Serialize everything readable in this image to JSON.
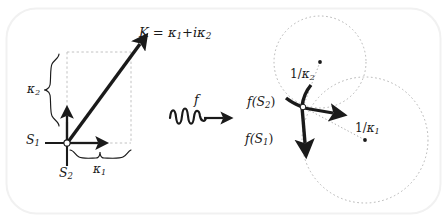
{
  "figure": {
    "background_color": "#ffffff",
    "frame_color": "#f0f0f0",
    "ink_color": "#1a1a1a",
    "dash_color": "#b0b0b0"
  },
  "left_panel": {
    "name": "complex-curvature-vector-diagram",
    "origin_labels": {
      "s1": "S",
      "s1_sub": "1",
      "s2": "S",
      "s2_sub": "2"
    },
    "vector_label": {
      "symbol": "K",
      "equals": " = ",
      "kappa1": "κ",
      "kappa1_sub": "1",
      "plus_i": "+i",
      "kappa2": "κ",
      "kappa2_sub": "2",
      "full": "K = κ1+iκ2"
    },
    "brace_labels": {
      "horizontal": "κ",
      "horizontal_sub": "1",
      "vertical": "κ",
      "vertical_sub": "2"
    }
  },
  "middle_panel": {
    "name": "map-arrow",
    "map_label": "f",
    "glyph": "squiggly-arrow-right"
  },
  "right_panel": {
    "name": "osculating-circles-diagram",
    "labels": {
      "f_s1": "f(S",
      "f_s1_sub": "1",
      "f_s1_close": ")",
      "f_s2": "f(S",
      "f_s2_sub": "2",
      "f_s2_close": ")",
      "radius1_num": "1/",
      "radius1_kappa": "κ",
      "radius1_sub": "1",
      "radius2_num": "1/",
      "radius2_kappa": "κ",
      "radius2_sub": "2"
    },
    "circles": [
      {
        "name": "circle-radius-1-over-kappa2",
        "cx": 320,
        "cy": 62,
        "r": 46
      },
      {
        "name": "circle-radius-1-over-kappa1",
        "cx": 365,
        "cy": 140,
        "r": 63
      }
    ]
  }
}
